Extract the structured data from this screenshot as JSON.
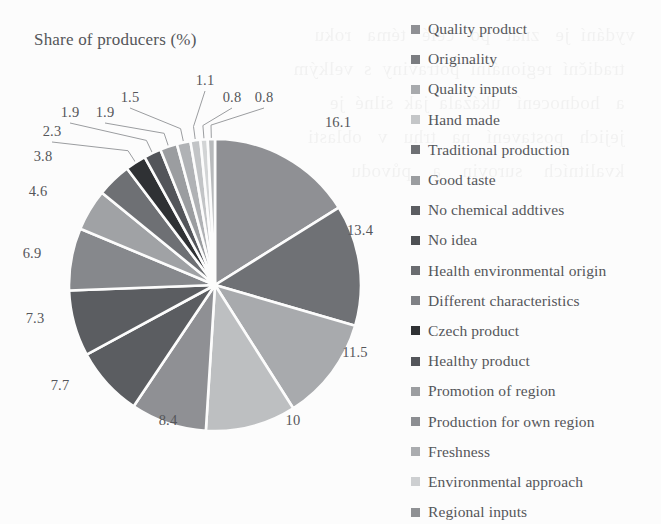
{
  "chart_data": {
    "type": "pie",
    "title": "Share of producers (%)",
    "xlabel": "",
    "ylabel": "",
    "legend_position": "right",
    "grid": false,
    "value_unit": "%",
    "start_angle_deg": 0,
    "direction": "clockwise",
    "categories": [
      "Quality product",
      "Originality",
      "Quality inputs",
      "Hand made",
      "Traditional production",
      "Good taste",
      "No chemical addtives",
      "No idea",
      "Health environmental origin",
      "Different characteristics",
      "Czech product",
      "Healthy product",
      "Promotion of region",
      "Production for own region",
      "Freshness",
      "Environmental approach",
      "Regional inputs"
    ],
    "values": [
      16.1,
      13.4,
      11.5,
      10,
      8.4,
      7.7,
      7.3,
      6.9,
      4.6,
      3.8,
      2.3,
      1.9,
      1.9,
      1.5,
      1.1,
      0.8,
      0.8
    ],
    "labels": [
      "16.1",
      "13.4",
      "11.5",
      "10",
      "8.4",
      "7.7",
      "7.3",
      "6.9",
      "4.6",
      "3.8",
      "2.3",
      "1.9",
      "1.9",
      "1.5",
      "1.1",
      "0.8",
      "0.8"
    ],
    "colors": [
      "#8f9094",
      "#6f7175",
      "#a8aaad",
      "#bdbfc1",
      "#8f9094",
      "#5b5d61",
      "#5b5d61",
      "#86888c",
      "#a0a2a5",
      "#6e7074",
      "#2f3134",
      "#53555a",
      "#9b9da0",
      "#b0b2b5",
      "#c2c4c6",
      "#d2d4d5",
      "#b8babc"
    ],
    "slice_separator_color": "#fcfcfc"
  },
  "legend": {
    "items": [
      {
        "label": "Quality product",
        "color": "#8f9094"
      },
      {
        "label": "Originality",
        "color": "#7b7d81"
      },
      {
        "label": "Quality inputs",
        "color": "#a8aaad"
      },
      {
        "label": "Hand made",
        "color": "#c4c6c8"
      },
      {
        "label": "Traditional production",
        "color": "#6e7074"
      },
      {
        "label": "Good taste",
        "color": "#9b9da0"
      },
      {
        "label": "No chemical addtives",
        "color": "#5b5d61"
      },
      {
        "label": "No idea",
        "color": "#4e5054"
      },
      {
        "label": "Health environmental origin",
        "color": "#6a6c70"
      },
      {
        "label": "Different characteristics",
        "color": "#7f8185"
      },
      {
        "label": "Czech product",
        "color": "#2f3134"
      },
      {
        "label": "Healthy product",
        "color": "#53555a"
      },
      {
        "label": "Promotion of region",
        "color": "#9b9da0"
      },
      {
        "label": "Production for own region",
        "color": "#8c8e92"
      },
      {
        "label": "Freshness",
        "color": "#aaacaf"
      },
      {
        "label": "Environmental approach",
        "color": "#cdcfd1"
      },
      {
        "label": "Regional inputs",
        "color": "#8f9194"
      }
    ]
  },
  "pie_geometry": {
    "center_x": 215,
    "center_y": 285,
    "radius": 146,
    "label_radius": 178
  },
  "bleed_text": "vydání  je   znát   po   celé   téma   roku\n  tradiční  regionální  potraviny  s  velkým\n  a   hodnocení   ukázala  jak  silné  je\n  jejich   postavení   na   trhu   v   oblasti\n  kvalitních    surovin    a    původu"
}
